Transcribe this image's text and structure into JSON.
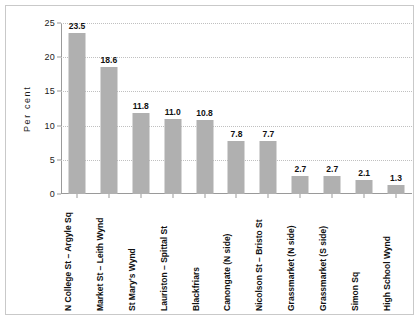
{
  "chart_data": {
    "type": "bar",
    "title": "",
    "subtitle": "",
    "xlabel": "",
    "ylabel": "Per cent",
    "ylim": [
      0,
      25
    ],
    "yticks": [
      0,
      5,
      10,
      15,
      20,
      25
    ],
    "ytick_labels": [
      "0",
      "5",
      "10",
      "15",
      "20",
      "25"
    ],
    "grid": true,
    "grid_style": "dotted-horizontal",
    "legend": "none",
    "bar_color": "#b0b0b0",
    "data_labels": true,
    "categories": [
      "N College St – Argyle Sq",
      "Market St – Leith Wynd",
      "St Mary's Wynd",
      "Lauriston – Spittal St",
      "Blackfriars",
      "Canongate (N side)",
      "Nicolson St – Bristo St",
      "Grassmarket (N side)",
      "Grassmarket (S side)",
      "Simon Sq",
      "High School Wynd"
    ],
    "values": [
      23.5,
      18.6,
      11.8,
      11.0,
      10.8,
      7.8,
      7.7,
      2.7,
      2.7,
      2.1,
      1.3
    ],
    "value_labels": [
      "23.5",
      "18.6",
      "11.8",
      "11.0",
      "10.8",
      "7.8",
      "7.7",
      "2.7",
      "2.7",
      "2.1",
      "1.3"
    ]
  }
}
